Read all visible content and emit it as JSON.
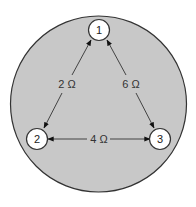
{
  "diagram": {
    "type": "resistor-network",
    "background_color": "#c8c8c8",
    "nodes": [
      {
        "id": "1",
        "label": "1"
      },
      {
        "id": "2",
        "label": "2"
      },
      {
        "id": "3",
        "label": "3"
      }
    ],
    "edges": [
      {
        "from": "1",
        "to": "2",
        "label": "2 Ω"
      },
      {
        "from": "1",
        "to": "3",
        "label": "6 Ω"
      },
      {
        "from": "2",
        "to": "3",
        "label": "4 Ω"
      }
    ]
  }
}
